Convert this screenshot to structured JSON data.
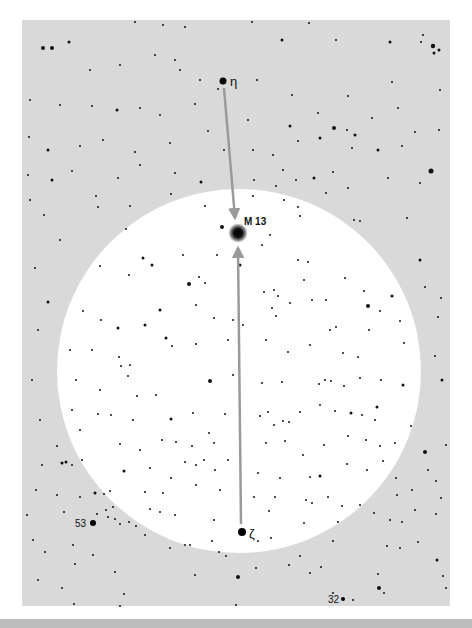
{
  "chart": {
    "panel": {
      "x": 22,
      "y": 20,
      "w": 428,
      "h": 586,
      "color": "#d9d9d9"
    },
    "field_circle": {
      "cx": 239,
      "cy": 371,
      "r": 182,
      "color": "#ffffff"
    },
    "arrow_color": "#9a9a9a",
    "labels": {
      "eta": "η",
      "m13": "M 13",
      "zeta": "ζ",
      "star53": "53",
      "star32": "32"
    },
    "named_objects": [
      {
        "id": "eta",
        "x": 223,
        "y": 81,
        "r": 3.5
      },
      {
        "id": "m13",
        "x": 238,
        "y": 233,
        "r": 6
      },
      {
        "id": "zeta",
        "x": 242,
        "y": 532,
        "r": 4
      },
      {
        "id": "star53",
        "x": 93,
        "y": 523,
        "r": 3
      },
      {
        "id": "star32",
        "x": 343,
        "y": 599,
        "r": 2
      }
    ],
    "arrows": [
      {
        "from": [
          224,
          88
        ],
        "to": [
          235,
          218
        ]
      },
      {
        "from": [
          241,
          524
        ],
        "to": [
          238,
          248
        ]
      }
    ],
    "stars": [
      [
        43,
        48,
        2
      ],
      [
        52,
        48,
        2
      ],
      [
        69,
        42,
        1.5
      ],
      [
        135,
        22,
        1
      ],
      [
        163,
        25,
        1
      ],
      [
        185,
        27,
        1
      ],
      [
        252,
        22,
        1
      ],
      [
        282,
        40,
        1.5
      ],
      [
        309,
        23,
        1
      ],
      [
        336,
        40,
        1
      ],
      [
        390,
        42,
        1.5
      ],
      [
        423,
        35,
        1
      ],
      [
        433,
        46,
        2.2
      ],
      [
        439,
        50,
        1.5
      ],
      [
        434,
        53,
        1.5
      ],
      [
        421,
        42,
        1
      ],
      [
        90,
        70,
        1
      ],
      [
        120,
        65,
        1
      ],
      [
        155,
        55,
        1
      ],
      [
        175,
        60,
        1
      ],
      [
        180,
        70,
        1
      ],
      [
        200,
        80,
        1
      ],
      [
        257,
        80,
        1
      ],
      [
        292,
        95,
        1
      ],
      [
        348,
        96,
        1
      ],
      [
        392,
        82,
        1
      ],
      [
        440,
        90,
        1
      ],
      [
        30,
        100,
        1
      ],
      [
        60,
        105,
        1
      ],
      [
        92,
        106,
        1
      ],
      [
        117,
        110,
        1.5
      ],
      [
        140,
        108,
        1
      ],
      [
        160,
        115,
        1
      ],
      [
        195,
        104,
        1
      ],
      [
        218,
        89,
        1
      ],
      [
        248,
        120,
        1
      ],
      [
        290,
        126,
        1.5
      ],
      [
        318,
        113,
        1
      ],
      [
        334,
        128,
        2
      ],
      [
        347,
        130,
        1
      ],
      [
        355,
        135,
        1.5
      ],
      [
        372,
        118,
        1
      ],
      [
        398,
        108,
        1
      ],
      [
        415,
        132,
        1
      ],
      [
        439,
        130,
        1
      ],
      [
        29,
        137,
        1
      ],
      [
        48,
        150,
        1.5
      ],
      [
        80,
        146,
        1
      ],
      [
        103,
        140,
        1
      ],
      [
        135,
        152,
        1
      ],
      [
        170,
        143,
        1
      ],
      [
        208,
        131,
        1
      ],
      [
        224,
        150,
        1
      ],
      [
        253,
        150,
        1
      ],
      [
        273,
        155,
        1
      ],
      [
        298,
        141,
        1
      ],
      [
        320,
        138,
        1.5
      ],
      [
        352,
        148,
        1
      ],
      [
        378,
        150,
        1.5
      ],
      [
        402,
        146,
        1
      ],
      [
        431,
        171,
        2.5
      ],
      [
        28,
        175,
        1
      ],
      [
        52,
        180,
        1.5
      ],
      [
        72,
        171,
        1
      ],
      [
        96,
        196,
        1
      ],
      [
        118,
        178,
        1
      ],
      [
        140,
        165,
        1
      ],
      [
        175,
        173,
        1
      ],
      [
        201,
        182,
        1.5
      ],
      [
        254,
        180,
        1
      ],
      [
        283,
        170,
        1
      ],
      [
        296,
        180,
        1
      ],
      [
        314,
        178,
        1.5
      ],
      [
        333,
        172,
        1
      ],
      [
        348,
        188,
        1
      ],
      [
        388,
        178,
        1
      ],
      [
        420,
        183,
        1
      ],
      [
        30,
        200,
        1
      ],
      [
        44,
        215,
        1
      ],
      [
        98,
        207,
        1
      ],
      [
        130,
        206,
        1
      ],
      [
        171,
        194,
        1
      ],
      [
        205,
        206,
        1
      ],
      [
        222,
        227,
        2
      ],
      [
        253,
        196,
        1
      ],
      [
        276,
        186,
        1
      ],
      [
        284,
        200,
        1
      ],
      [
        298,
        207,
        1
      ],
      [
        300,
        216,
        1
      ],
      [
        326,
        193,
        1
      ],
      [
        360,
        221,
        1
      ],
      [
        407,
        218,
        1
      ],
      [
        126,
        229,
        1
      ],
      [
        143,
        258,
        1.5
      ],
      [
        152,
        265,
        1.5
      ],
      [
        183,
        255,
        1
      ],
      [
        217,
        255,
        1
      ],
      [
        240,
        265,
        1.5
      ],
      [
        262,
        245,
        1
      ],
      [
        270,
        235,
        1
      ],
      [
        298,
        260,
        1
      ],
      [
        308,
        262,
        1
      ],
      [
        354,
        220,
        1
      ],
      [
        60,
        240,
        1
      ],
      [
        35,
        268,
        1
      ],
      [
        100,
        266,
        1
      ],
      [
        129,
        275,
        1
      ],
      [
        189,
        284,
        2
      ],
      [
        205,
        283,
        1
      ],
      [
        199,
        277,
        1
      ],
      [
        264,
        292,
        1
      ],
      [
        274,
        290,
        1
      ],
      [
        278,
        296,
        1
      ],
      [
        304,
        280,
        1
      ],
      [
        326,
        300,
        1
      ],
      [
        345,
        278,
        1
      ],
      [
        364,
        291,
        1
      ],
      [
        392,
        296,
        1.5
      ],
      [
        420,
        260,
        1.5
      ],
      [
        425,
        287,
        1
      ],
      [
        441,
        298,
        1
      ],
      [
        48,
        302,
        1.5
      ],
      [
        83,
        311,
        1
      ],
      [
        101,
        320,
        1
      ],
      [
        118,
        328,
        1.5
      ],
      [
        145,
        325,
        1.5
      ],
      [
        160,
        310,
        1.5
      ],
      [
        196,
        305,
        1
      ],
      [
        214,
        318,
        1
      ],
      [
        233,
        320,
        1
      ],
      [
        243,
        325,
        1
      ],
      [
        272,
        308,
        1
      ],
      [
        276,
        316,
        1
      ],
      [
        290,
        303,
        1
      ],
      [
        312,
        300,
        1
      ],
      [
        330,
        330,
        1
      ],
      [
        336,
        327,
        1
      ],
      [
        368,
        306,
        2
      ],
      [
        380,
        311,
        1
      ],
      [
        400,
        321,
        1
      ],
      [
        438,
        317,
        1
      ],
      [
        38,
        330,
        1
      ],
      [
        70,
        350,
        1
      ],
      [
        92,
        350,
        1
      ],
      [
        119,
        357,
        1
      ],
      [
        121,
        366,
        1
      ],
      [
        130,
        365,
        1
      ],
      [
        128,
        376,
        1
      ],
      [
        166,
        338,
        1.5
      ],
      [
        172,
        346,
        1
      ],
      [
        196,
        344,
        1
      ],
      [
        228,
        340,
        1
      ],
      [
        266,
        340,
        1
      ],
      [
        288,
        352,
        1
      ],
      [
        310,
        345,
        1
      ],
      [
        343,
        353,
        1
      ],
      [
        358,
        357,
        1
      ],
      [
        369,
        330,
        1
      ],
      [
        404,
        343,
        1
      ],
      [
        435,
        356,
        1
      ],
      [
        32,
        380,
        1
      ],
      [
        76,
        380,
        1
      ],
      [
        100,
        390,
        1
      ],
      [
        137,
        396,
        1
      ],
      [
        156,
        395,
        1
      ],
      [
        210,
        381,
        2
      ],
      [
        233,
        375,
        1
      ],
      [
        262,
        383,
        1
      ],
      [
        282,
        382,
        1
      ],
      [
        319,
        384,
        1
      ],
      [
        325,
        380,
        1
      ],
      [
        331,
        381,
        1
      ],
      [
        344,
        386,
        1
      ],
      [
        360,
        378,
        1
      ],
      [
        381,
        380,
        1
      ],
      [
        403,
        385,
        1.5
      ],
      [
        442,
        380,
        1.5
      ],
      [
        40,
        420,
        1
      ],
      [
        72,
        410,
        1
      ],
      [
        80,
        430,
        1
      ],
      [
        98,
        414,
        1
      ],
      [
        111,
        415,
        1
      ],
      [
        133,
        420,
        1
      ],
      [
        171,
        419,
        1.5
      ],
      [
        193,
        413,
        1
      ],
      [
        209,
        433,
        1
      ],
      [
        225,
        414,
        1
      ],
      [
        260,
        416,
        1
      ],
      [
        268,
        412,
        1
      ],
      [
        274,
        425,
        1
      ],
      [
        283,
        421,
        1
      ],
      [
        289,
        422,
        1
      ],
      [
        300,
        412,
        1
      ],
      [
        320,
        405,
        1
      ],
      [
        335,
        411,
        1
      ],
      [
        351,
        413,
        1.5
      ],
      [
        362,
        415,
        1
      ],
      [
        377,
        407,
        1.5
      ],
      [
        375,
        420,
        1
      ],
      [
        411,
        426,
        1
      ],
      [
        57,
        446,
        1
      ],
      [
        82,
        460,
        1
      ],
      [
        120,
        444,
        1
      ],
      [
        140,
        450,
        1
      ],
      [
        162,
        440,
        1
      ],
      [
        176,
        442,
        1
      ],
      [
        192,
        446,
        1
      ],
      [
        214,
        443,
        1
      ],
      [
        228,
        460,
        1
      ],
      [
        240,
        450,
        1
      ],
      [
        266,
        443,
        1
      ],
      [
        285,
        441,
        1
      ],
      [
        303,
        455,
        1
      ],
      [
        324,
        445,
        1
      ],
      [
        348,
        436,
        1
      ],
      [
        366,
        440,
        1
      ],
      [
        380,
        446,
        1
      ],
      [
        395,
        443,
        1
      ],
      [
        425,
        452,
        2
      ],
      [
        446,
        445,
        1
      ],
      [
        42,
        465,
        1
      ],
      [
        62,
        463,
        1.5
      ],
      [
        66,
        462,
        1.5
      ],
      [
        72,
        465,
        1
      ],
      [
        124,
        471,
        1.5
      ],
      [
        150,
        468,
        1
      ],
      [
        171,
        478,
        1
      ],
      [
        185,
        462,
        1
      ],
      [
        196,
        465,
        1
      ],
      [
        204,
        460,
        1
      ],
      [
        215,
        470,
        1
      ],
      [
        258,
        473,
        1
      ],
      [
        280,
        478,
        1
      ],
      [
        310,
        477,
        1
      ],
      [
        320,
        476,
        1.5
      ],
      [
        347,
        464,
        1
      ],
      [
        367,
        470,
        1
      ],
      [
        383,
        461,
        1
      ],
      [
        396,
        478,
        1
      ],
      [
        428,
        470,
        1
      ],
      [
        436,
        481,
        1
      ],
      [
        36,
        490,
        1
      ],
      [
        57,
        495,
        1
      ],
      [
        80,
        497,
        1
      ],
      [
        95,
        493,
        1.5
      ],
      [
        104,
        494,
        1
      ],
      [
        110,
        491,
        1
      ],
      [
        145,
        492,
        1
      ],
      [
        163,
        493,
        1
      ],
      [
        196,
        485,
        1
      ],
      [
        220,
        490,
        1
      ],
      [
        254,
        497,
        1
      ],
      [
        275,
        497,
        1
      ],
      [
        306,
        500,
        1
      ],
      [
        312,
        503,
        1
      ],
      [
        328,
        497,
        1
      ],
      [
        342,
        506,
        1
      ],
      [
        360,
        505,
        1
      ],
      [
        397,
        495,
        1
      ],
      [
        412,
        490,
        1
      ],
      [
        441,
        498,
        1
      ],
      [
        27,
        515,
        1
      ],
      [
        64,
        512,
        1
      ],
      [
        97,
        514,
        1
      ],
      [
        106,
        510,
        1
      ],
      [
        113,
        507,
        1
      ],
      [
        108,
        517,
        1
      ],
      [
        115,
        519,
        1
      ],
      [
        120,
        524,
        1
      ],
      [
        129,
        522,
        1
      ],
      [
        136,
        526,
        1
      ],
      [
        150,
        509,
        1
      ],
      [
        160,
        512,
        1
      ],
      [
        175,
        515,
        1
      ],
      [
        214,
        520,
        1
      ],
      [
        269,
        511,
        1
      ],
      [
        304,
        523,
        1
      ],
      [
        338,
        522,
        1
      ],
      [
        374,
        513,
        1
      ],
      [
        390,
        520,
        1
      ],
      [
        402,
        522,
        1
      ],
      [
        415,
        510,
        1
      ],
      [
        436,
        514,
        1
      ],
      [
        33,
        540,
        1
      ],
      [
        45,
        552,
        1
      ],
      [
        73,
        545,
        1
      ],
      [
        93,
        555,
        1
      ],
      [
        145,
        535,
        1
      ],
      [
        170,
        548,
        1
      ],
      [
        185,
        545,
        1
      ],
      [
        190,
        545,
        1
      ],
      [
        212,
        541,
        1
      ],
      [
        219,
        552,
        1
      ],
      [
        226,
        556,
        1
      ],
      [
        258,
        541,
        1
      ],
      [
        271,
        538,
        1
      ],
      [
        300,
        556,
        1
      ],
      [
        333,
        541,
        1
      ],
      [
        387,
        546,
        1
      ],
      [
        400,
        548,
        1
      ],
      [
        418,
        542,
        1
      ],
      [
        38,
        580,
        1
      ],
      [
        62,
        588,
        1
      ],
      [
        75,
        564,
        1
      ],
      [
        115,
        572,
        1
      ],
      [
        124,
        594,
        1
      ],
      [
        195,
        575,
        1
      ],
      [
        238,
        577,
        2
      ],
      [
        256,
        568,
        1
      ],
      [
        289,
        565,
        1
      ],
      [
        310,
        573,
        1
      ],
      [
        321,
        567,
        1
      ],
      [
        333,
        593,
        1
      ],
      [
        353,
        600,
        1
      ],
      [
        378,
        574,
        1
      ],
      [
        379,
        588,
        2
      ],
      [
        384,
        593,
        1
      ],
      [
        437,
        560,
        1.5
      ],
      [
        443,
        576,
        1
      ],
      [
        446,
        588,
        1
      ],
      [
        74,
        604,
        1
      ],
      [
        120,
        606,
        1
      ],
      [
        236,
        605,
        1
      ]
    ]
  }
}
